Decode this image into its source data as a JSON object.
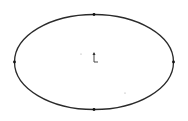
{
  "canvas": {
    "width": 188,
    "height": 121,
    "background": "#ffffff"
  },
  "ellipse": {
    "cx": 94,
    "cy": 62,
    "rx": 79.5,
    "ry": 47.5,
    "stroke": "#2a2a2a",
    "stroke_width": 1.3
  },
  "points": [
    {
      "name": "top-quadrant-point",
      "x": 94,
      "y": 14.5
    },
    {
      "name": "bottom-quadrant-point",
      "x": 94,
      "y": 109.5
    },
    {
      "name": "left-quadrant-point",
      "x": 14.5,
      "y": 62
    },
    {
      "name": "right-quadrant-point",
      "x": 173.5,
      "y": 62
    }
  ],
  "origin_marker": {
    "x": 94,
    "y": 62,
    "icon": "coordinate-origin-icon",
    "color": "#333333"
  },
  "stray_dots": [
    {
      "x": 81,
      "y": 54
    },
    {
      "x": 125,
      "y": 93
    }
  ]
}
